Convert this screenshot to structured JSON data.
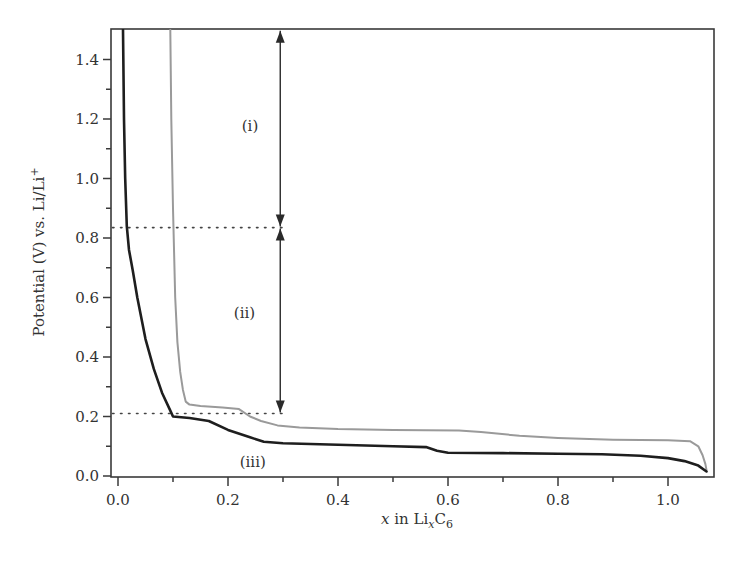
{
  "chart_data": {
    "type": "line",
    "title": "",
    "xlabel": "x in LixC6",
    "xlabel_parts": {
      "var": "x",
      "mid": " in Li",
      "sub1": "x",
      "c": "C",
      "sub2": "6"
    },
    "ylabel": "Potential (V) vs. Li/Li+",
    "ylabel_parts": {
      "main": "Potential (V) vs. Li/Li",
      "sup": "+"
    },
    "xlim": [
      -0.02,
      1.09
    ],
    "ylim": [
      0.0,
      1.5
    ],
    "x_ticks": [
      0.0,
      0.2,
      0.4,
      0.6,
      0.8,
      1.0
    ],
    "x_tick_labels": [
      "0.0",
      "0.2",
      "0.4",
      "0.6",
      "0.8",
      "1.0"
    ],
    "x_minor_ticks": [
      0.1,
      0.3,
      0.5,
      0.7,
      0.9
    ],
    "y_ticks": [
      0.0,
      0.2,
      0.4,
      0.6,
      0.8,
      1.0,
      1.2,
      1.4
    ],
    "y_tick_labels": [
      "0.0",
      "0.2",
      "0.4",
      "0.6",
      "0.8",
      "1.0",
      "1.2",
      "1.4"
    ],
    "y_minor_ticks": [
      0.1,
      0.3,
      0.5,
      0.7,
      0.9,
      1.1,
      1.3
    ],
    "grid": false,
    "legend": null,
    "series": [
      {
        "name": "first-cycle (black)",
        "color": "#1e1e1e",
        "width": 2.6,
        "x": [
          0.009,
          0.011,
          0.013,
          0.016,
          0.02,
          0.027,
          0.035,
          0.05,
          0.065,
          0.08,
          0.095,
          0.1,
          0.13,
          0.165,
          0.2,
          0.24,
          0.265,
          0.3,
          0.4,
          0.5,
          0.56,
          0.58,
          0.6,
          0.7,
          0.8,
          0.88,
          0.95,
          1.0,
          1.03,
          1.055,
          1.07
        ],
        "y": [
          1.5,
          1.2,
          1.0,
          0.84,
          0.76,
          0.69,
          0.6,
          0.46,
          0.36,
          0.28,
          0.22,
          0.2,
          0.195,
          0.185,
          0.155,
          0.13,
          0.115,
          0.11,
          0.105,
          0.1,
          0.097,
          0.085,
          0.078,
          0.077,
          0.075,
          0.073,
          0.068,
          0.06,
          0.05,
          0.035,
          0.015
        ]
      },
      {
        "name": "subsequent-cycle (gray)",
        "color": "#9a9a9a",
        "width": 2.0,
        "x": [
          0.095,
          0.097,
          0.1,
          0.104,
          0.108,
          0.113,
          0.118,
          0.123,
          0.13,
          0.15,
          0.19,
          0.22,
          0.24,
          0.26,
          0.29,
          0.33,
          0.4,
          0.5,
          0.62,
          0.66,
          0.73,
          0.8,
          0.9,
          1.0,
          1.04,
          1.055,
          1.063,
          1.068,
          1.07
        ],
        "y": [
          1.5,
          1.2,
          0.9,
          0.6,
          0.45,
          0.35,
          0.29,
          0.25,
          0.24,
          0.235,
          0.23,
          0.225,
          0.2,
          0.185,
          0.17,
          0.163,
          0.158,
          0.155,
          0.153,
          0.148,
          0.135,
          0.128,
          0.122,
          0.12,
          0.117,
          0.1,
          0.07,
          0.04,
          0.02
        ]
      }
    ],
    "reference_lines": [
      {
        "type": "horizontal-dotted",
        "y": 0.835,
        "x_from": -0.01,
        "x_to": 0.305
      },
      {
        "type": "horizontal-dotted",
        "y": 0.21,
        "x_from": -0.01,
        "x_to": 0.305
      }
    ],
    "arrows": [
      {
        "label": "(i)",
        "x": 0.295,
        "y_from": 1.5,
        "y_to": 0.835,
        "double_headed": true
      },
      {
        "label": "(ii)",
        "x": 0.295,
        "y_from": 0.835,
        "y_to": 0.21,
        "double_headed": true
      }
    ],
    "annotations": [
      {
        "text": "(i)",
        "x": 0.24,
        "y": 1.16
      },
      {
        "text": "(ii)",
        "x": 0.23,
        "y": 0.53
      },
      {
        "text": "(iii)",
        "x": 0.245,
        "y": 0.03
      }
    ]
  },
  "labels": {
    "region_i": "(i)",
    "region_ii": "(ii)",
    "region_iii": "(iii)"
  }
}
